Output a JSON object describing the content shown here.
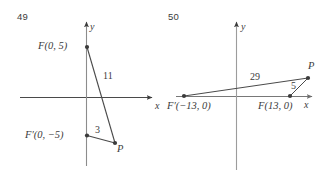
{
  "figure": {
    "kind": "two-panel-coordinate-geometry-diagram",
    "background_color": "#ffffff",
    "ink_color": "#3b3b3b",
    "axis_color": "#9a9a9a",
    "panels": [
      {
        "id": "panel-49",
        "problem_number": "49",
        "axes": {
          "x_axis_label": "x",
          "y_axis_label": "y"
        },
        "points": [
          {
            "name": "F",
            "label": "F(0, 5)",
            "x": 0,
            "y": 5
          },
          {
            "name": "F-prime",
            "label": "F′(0, −5)",
            "x": 0,
            "y": -5
          },
          {
            "name": "P",
            "label": "P"
          }
        ],
        "segments": [
          {
            "from": "F",
            "to": "P",
            "length_label": "11"
          },
          {
            "from": "F-prime",
            "to": "P",
            "length_label": "3"
          }
        ]
      },
      {
        "id": "panel-50",
        "problem_number": "50",
        "axes": {
          "x_axis_label": "x",
          "y_axis_label": "y"
        },
        "points": [
          {
            "name": "F-prime",
            "label": "F′(−13, 0)",
            "x": -13,
            "y": 0
          },
          {
            "name": "F",
            "label": "F(13, 0)",
            "x": 13,
            "y": 0
          },
          {
            "name": "P",
            "label": "P"
          }
        ],
        "segments": [
          {
            "from": "F-prime",
            "to": "P",
            "length_label": "29"
          },
          {
            "from": "F",
            "to": "P",
            "length_label": "5"
          }
        ]
      }
    ]
  }
}
